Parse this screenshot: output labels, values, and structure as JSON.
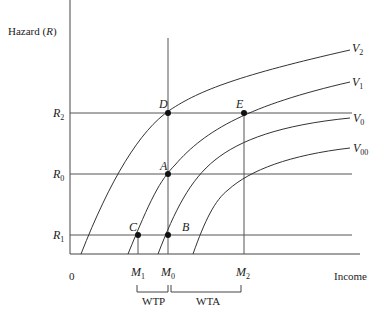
{
  "diagram": {
    "y_axis_label": "Hazard",
    "y_axis_symbol": "R",
    "x_axis_label": "Income",
    "origin_label": "0",
    "hazard_levels": [
      {
        "name": "R",
        "sub": "2",
        "y": 113
      },
      {
        "name": "R",
        "sub": "0",
        "y": 174
      },
      {
        "name": "R",
        "sub": "1",
        "y": 235
      }
    ],
    "income_levels": [
      {
        "name": "M",
        "sub": "1",
        "x": 138
      },
      {
        "name": "M",
        "sub": "0",
        "x": 168
      },
      {
        "name": "M",
        "sub": "2",
        "x": 244
      }
    ],
    "curves": [
      {
        "name": "V",
        "sub": "2"
      },
      {
        "name": "V",
        "sub": "1"
      },
      {
        "name": "V",
        "sub": "0"
      },
      {
        "name": "V",
        "sub": "00"
      }
    ],
    "points": [
      {
        "label": "D",
        "x": 168,
        "y": 113
      },
      {
        "label": "E",
        "x": 244,
        "y": 113
      },
      {
        "label": "A",
        "x": 168,
        "y": 174
      },
      {
        "label": "B",
        "x": 168,
        "y": 235
      },
      {
        "label": "C",
        "x": 138,
        "y": 235
      }
    ],
    "brackets": [
      {
        "label": "WTP",
        "from": "M1",
        "to": "M0"
      },
      {
        "label": "WTA",
        "from": "M0",
        "to": "M2"
      }
    ],
    "colors": {
      "line": "#333333",
      "point": "#111111",
      "text": "#222222"
    }
  }
}
